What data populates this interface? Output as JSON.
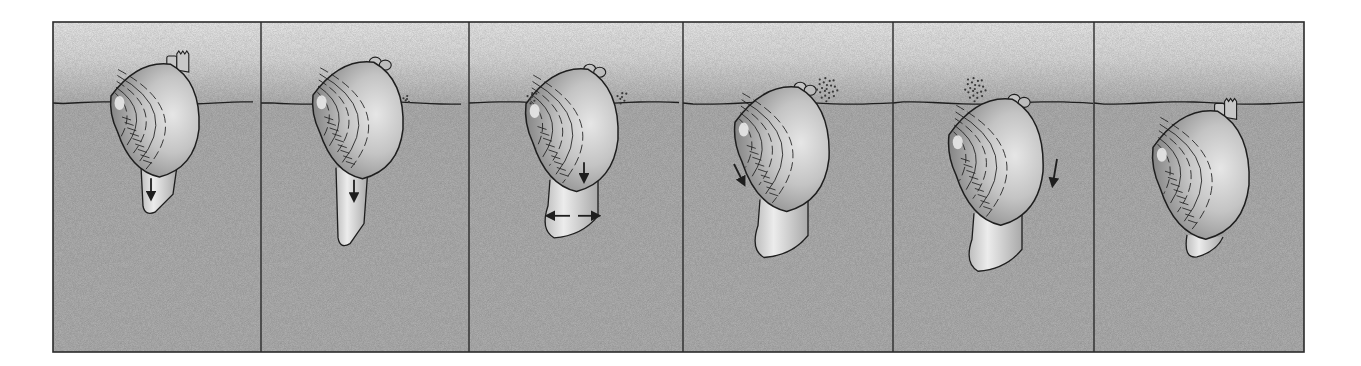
{
  "figure": {
    "panel_count": 6,
    "frame": {
      "x": 53,
      "y": 22,
      "x2": 1304,
      "y2": 352
    },
    "sediment_surface_y": 103,
    "colors": {
      "page_background": "#ffffff",
      "water_top": "#f0f0f0",
      "water_bottom": "#b8b8b8",
      "sediment": "#b6b6b6",
      "frame_line": "#2a2a2a",
      "shell_light": "#dcdcdc",
      "shell_mid": "#b0b0b0",
      "shell_dark": "#6f6f6f",
      "foot": "#cfcfcf",
      "ink": "#1e1e1e"
    }
  },
  "panels": [
    {
      "index": 1,
      "x": 53,
      "x2": 261,
      "stage": "foot probing downward into sediment",
      "shell_cx": 155,
      "shell_cy": 123,
      "shell_rx": 44,
      "shell_ry": 60,
      "siphons": "extended-fringed",
      "foot": "short-probe",
      "arrows": [
        "foot-down"
      ],
      "sediment_puff": "none"
    },
    {
      "index": 2,
      "x": 261,
      "x2": 469,
      "stage": "foot extending further",
      "shell_cx": 358,
      "shell_cy": 123,
      "shell_rx": 45,
      "shell_ry": 62,
      "siphons": "closed-rounded",
      "foot": "long-probe",
      "arrows": [
        "foot-down"
      ],
      "sediment_puff": "small-right"
    },
    {
      "index": 3,
      "x": 469,
      "x2": 683,
      "stage": "foot tip swells to form anchor",
      "shell_cx": 572,
      "shell_cy": 133,
      "shell_rx": 46,
      "shell_ry": 65,
      "siphons": "closed-rounded",
      "foot": "anchor-swollen",
      "arrows": [
        "shell-down",
        "foot-left",
        "foot-right"
      ],
      "sediment_puff": "both-sides"
    },
    {
      "index": 4,
      "x": 683,
      "x2": 893,
      "stage": "shell pulled down, water jetted out",
      "shell_cx": 782,
      "shell_cy": 152,
      "shell_rx": 47,
      "shell_ry": 66,
      "siphons": "closed-rounded",
      "foot": "anchor-swollen",
      "arrows": [
        "shell-rotate-down"
      ],
      "sediment_puff": "large-right"
    },
    {
      "index": 5,
      "x": 893,
      "x2": 1094,
      "stage": "shell rocks deeper into sediment",
      "shell_cx": 996,
      "shell_cy": 165,
      "shell_rx": 47,
      "shell_ry": 67,
      "siphons": "closed-rounded",
      "foot": "anchor-swollen",
      "arrows": [
        "shell-right-down"
      ],
      "sediment_puff": "large-left"
    },
    {
      "index": 6,
      "x": 1094,
      "x2": 1304,
      "stage": "clam buried, siphons at surface",
      "shell_cx": 1201,
      "shell_cy": 178,
      "shell_rx": 48,
      "shell_ry": 68,
      "siphons": "extended-fringed",
      "foot": "retracted",
      "arrows": [],
      "sediment_puff": "none"
    }
  ]
}
